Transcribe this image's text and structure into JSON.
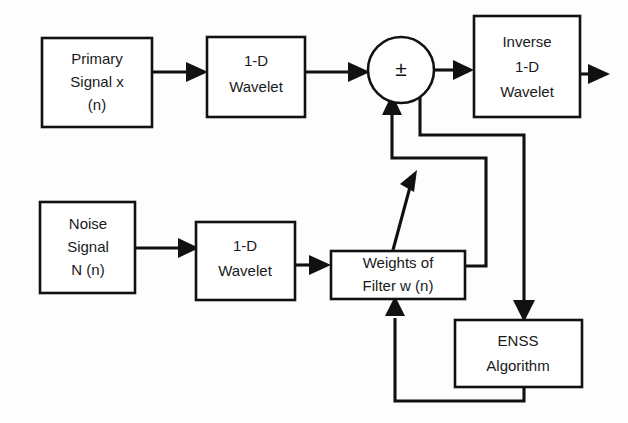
{
  "diagram": {
    "canvas": {
      "width": 628,
      "height": 423,
      "background": "#fdfdfd"
    },
    "line_color": "#111111",
    "box_fill": "#ffffff",
    "blocks": {
      "primary_signal": {
        "line1": "Primary",
        "line2": "Signal x",
        "line3": "(n)"
      },
      "wavelet_top": {
        "line1": "1-D",
        "line2": "Wavelet"
      },
      "summing_node": {
        "symbol": "±"
      },
      "inverse_wavelet": {
        "line1": "Inverse",
        "line2": "1-D",
        "line3": "Wavelet"
      },
      "noise_signal": {
        "line1": "Noise",
        "line2": "Signal",
        "line3": "N (n)"
      },
      "wavelet_bottom": {
        "line1": "1-D",
        "line2": "Wavelet"
      },
      "weights_filter": {
        "line1": "Weights of",
        "line2": "Filter w (n)"
      },
      "enss": {
        "line1": "ENSS",
        "line2": "Algorithm"
      }
    },
    "connections": [
      {
        "from": "primary_signal",
        "to": "wavelet_top",
        "style": "arrow"
      },
      {
        "from": "wavelet_top",
        "to": "summing_node",
        "style": "arrow"
      },
      {
        "from": "summing_node",
        "to": "inverse_wavelet",
        "style": "arrow"
      },
      {
        "from": "inverse_wavelet",
        "to": "output",
        "style": "arrow"
      },
      {
        "from": "noise_signal",
        "to": "wavelet_bottom",
        "style": "arrow"
      },
      {
        "from": "wavelet_bottom",
        "to": "weights_filter",
        "style": "arrow"
      },
      {
        "from": "weights_filter",
        "to": "summing_node",
        "style": "diagonal-arrow"
      },
      {
        "from": "summing_node_tap",
        "to": "weights_filter",
        "style": "feedback"
      },
      {
        "from": "summing_node_tap",
        "to": "enss",
        "style": "arrow"
      },
      {
        "from": "enss",
        "to": "weights_filter",
        "style": "feedback-arrow"
      }
    ]
  }
}
